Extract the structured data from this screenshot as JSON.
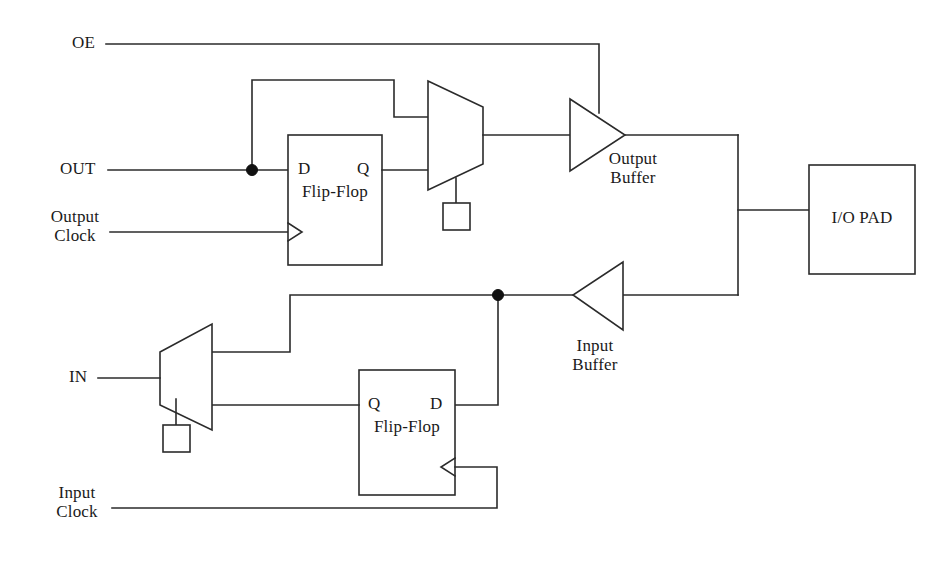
{
  "diagram": {
    "colors": {
      "line": "#2b2b2b",
      "junction": "#111111",
      "background": "#ffffff",
      "text": "#1a1a1a"
    },
    "signals": {
      "oe": "OE",
      "out": "OUT",
      "output_clock_line1": "Output",
      "output_clock_line2": "Clock",
      "in": "IN",
      "input_clock_line1": "Input",
      "input_clock_line2": "Clock"
    },
    "blocks": {
      "output_ff": {
        "d": "D",
        "q": "Q",
        "name": "Flip-Flop"
      },
      "input_ff": {
        "q": "Q",
        "d": "D",
        "name": "Flip-Flop"
      },
      "io_pad": {
        "label": "I/O PAD"
      },
      "output_buffer": {
        "line1": "Output",
        "line2": "Buffer"
      },
      "input_buffer": {
        "line1": "Input",
        "line2": "Buffer"
      },
      "output_mux": {
        "label": ""
      },
      "input_mux": {
        "label": ""
      },
      "output_mux_config": {
        "label": ""
      },
      "input_mux_config": {
        "label": ""
      }
    }
  }
}
